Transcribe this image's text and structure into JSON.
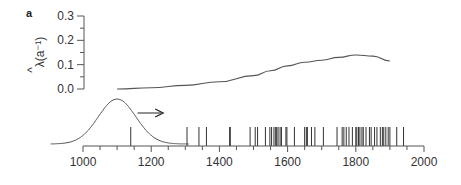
{
  "panel_label": "a",
  "chart_data": [
    {
      "type": "line",
      "title": "",
      "ylabel": "λ̂(a⁻¹)",
      "ylabel_hat": "^",
      "ylabel_text": "λ(a⁻¹)",
      "xlabel": "",
      "ylim": [
        0,
        0.3
      ],
      "yticks": [
        "0.0",
        "0.1",
        "0.2",
        "0.3"
      ],
      "grid": false,
      "series": [
        {
          "name": "rate",
          "x": [
            1100,
            1200,
            1300,
            1400,
            1500,
            1550,
            1600,
            1650,
            1700,
            1750,
            1800,
            1850,
            1900
          ],
          "values": [
            0.0,
            0.005,
            0.015,
            0.03,
            0.055,
            0.075,
            0.095,
            0.11,
            0.118,
            0.13,
            0.14,
            0.135,
            0.115
          ]
        }
      ]
    },
    {
      "type": "scatter",
      "subtype": "event-rug",
      "xlabel": "",
      "xlim": [
        900,
        2000
      ],
      "xticks": [
        "1000",
        "1200",
        "1400",
        "1600",
        "1800",
        "2000"
      ],
      "xtick_values": [
        1000,
        1200,
        1400,
        1600,
        1800,
        2000
      ],
      "events": [
        1140,
        1305,
        1340,
        1362,
        1430,
        1432,
        1490,
        1505,
        1512,
        1535,
        1548,
        1553,
        1560,
        1565,
        1568,
        1572,
        1578,
        1582,
        1595,
        1598,
        1620,
        1650,
        1655,
        1658,
        1670,
        1680,
        1705,
        1745,
        1760,
        1765,
        1772,
        1780,
        1790,
        1800,
        1803,
        1808,
        1812,
        1818,
        1822,
        1830,
        1840,
        1845,
        1855,
        1862,
        1872,
        1878,
        1882,
        1888,
        1895,
        1900,
        1920,
        1940
      ],
      "gaussian": {
        "mean": 1100,
        "sd": 55,
        "label": ""
      },
      "arrow": {
        "from": 1160,
        "to": 1235,
        "direction": "right"
      }
    }
  ]
}
